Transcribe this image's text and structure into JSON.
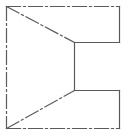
{
  "diagram": {
    "type": "technical-drawing-projection",
    "stroke_color": "#5a5a5a",
    "background": "#ffffff",
    "lines": [
      {
        "name": "top-edge",
        "x1": 6,
        "y1": 6,
        "x2": 119,
        "y2": 6,
        "style": "dash-dot"
      },
      {
        "name": "left-edge",
        "x1": 6,
        "y1": 6,
        "x2": 6,
        "y2": 128,
        "style": "dash-dot"
      },
      {
        "name": "bottom-edge",
        "x1": 6,
        "y1": 128,
        "x2": 119,
        "y2": 128,
        "style": "dash-dot"
      },
      {
        "name": "right-top-edge",
        "x1": 119,
        "y1": 6,
        "x2": 119,
        "y2": 42,
        "style": "solid"
      },
      {
        "name": "notch-top-edge",
        "x1": 74,
        "y1": 42,
        "x2": 119,
        "y2": 42,
        "style": "solid"
      },
      {
        "name": "notch-inner-edge",
        "x1": 74,
        "y1": 42,
        "x2": 74,
        "y2": 90,
        "style": "solid"
      },
      {
        "name": "notch-bottom-edge",
        "x1": 74,
        "y1": 90,
        "x2": 119,
        "y2": 90,
        "style": "solid"
      },
      {
        "name": "right-bottom-edge",
        "x1": 119,
        "y1": 90,
        "x2": 119,
        "y2": 128,
        "style": "solid"
      },
      {
        "name": "upper-diagonal",
        "x1": 6,
        "y1": 6,
        "x2": 74,
        "y2": 42,
        "style": "dash-dot"
      },
      {
        "name": "lower-diagonal",
        "x1": 6,
        "y1": 128,
        "x2": 74,
        "y2": 90,
        "style": "dash-dot"
      }
    ]
  }
}
